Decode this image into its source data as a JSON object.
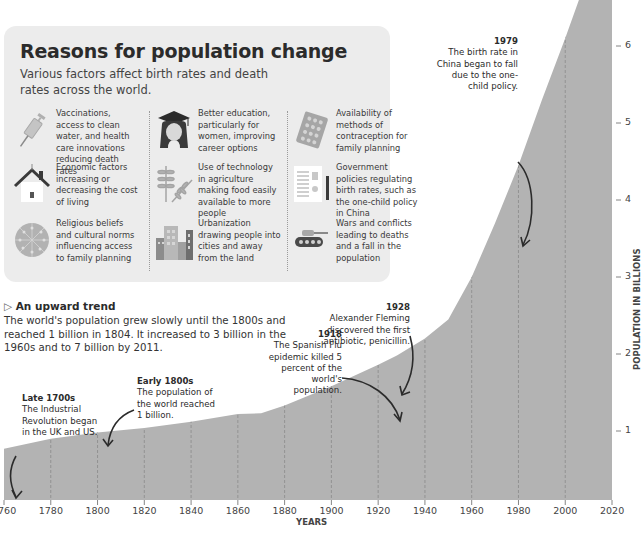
{
  "panel": {
    "title": "Reasons for population change",
    "subtitle": "Various factors affect birth rates and death rates across the world.",
    "factors": [
      {
        "icon": "syringe-icon",
        "text": "Vaccinations, access to clean water, and health care innovations reducing death rates"
      },
      {
        "icon": "graduate-icon",
        "text": "Better education, particularly for women, improving career options"
      },
      {
        "icon": "contraceptive-pill-icon",
        "text": "Availability of methods of contraception for family planning"
      },
      {
        "icon": "house-icon",
        "text": "Economic factors increasing or decreasing the cost of living"
      },
      {
        "icon": "wheat-icon",
        "text": "Use of technology in agriculture making food easily available to more people"
      },
      {
        "icon": "policy-document-icon",
        "text": "Government policies regulating birth rates, such as the one-child policy in China"
      },
      {
        "icon": "religious-symbols-icon",
        "text": "Religious beliefs and cultural norms influencing access to family planning"
      },
      {
        "icon": "city-buildings-icon",
        "text": "Urbanization drawing people into cities and away from the land"
      },
      {
        "icon": "tank-icon",
        "text": "Wars and conflicts leading to deaths and a fall in the population"
      }
    ]
  },
  "trend": {
    "marker": "▷",
    "heading": "An upward trend",
    "body": "The world's population grew slowly until the 1800s and reached 1 billion in 1804. It increased to 3 billion in the 1960s and to 7 billion by 2011."
  },
  "annotations": [
    {
      "id": "late1700s",
      "title": "Late 1700s",
      "text": "The Industrial Revolution began in the UK and US."
    },
    {
      "id": "early1800s",
      "title": "Early 1800s",
      "text": "The population of the world reached 1 billion."
    },
    {
      "id": "y1918",
      "title": "1918",
      "text": "The Spanish Flu epidemic killed 5 percent of the world's population."
    },
    {
      "id": "y1928",
      "title": "1928",
      "text": "Alexander Fleming discovered the first antibiotic, penicillin."
    },
    {
      "id": "y1979",
      "title": "1979",
      "text": "The birth rate in China began to fall due to the one-child policy."
    }
  ],
  "colors": {
    "area": "#b3b3b3",
    "panel": "#ececec",
    "text": "#2b2b2b",
    "gridline": "#8a8a8a"
  },
  "chart_data": {
    "type": "area",
    "title": "",
    "xlabel": "YEARS",
    "ylabel": "POPULATION IN BILLIONS",
    "x_ticks": [
      1760,
      1780,
      1800,
      1820,
      1840,
      1860,
      1880,
      1900,
      1920,
      1940,
      1960,
      1980,
      2000,
      2020
    ],
    "y_ticks": [
      1,
      2,
      3,
      4,
      5,
      6
    ],
    "xlim": [
      1760,
      2020
    ],
    "ylim": [
      0,
      6.5
    ],
    "grid": "vertical dashed lines at each 20-year tick",
    "x": [
      1760,
      1780,
      1800,
      1820,
      1840,
      1860,
      1870,
      1880,
      1900,
      1910,
      1920,
      1928,
      1940,
      1950,
      1960,
      1970,
      1980,
      1990,
      2000,
      2010,
      2020
    ],
    "values": [
      0.77,
      0.9,
      0.98,
      1.04,
      1.12,
      1.22,
      1.23,
      1.33,
      1.58,
      1.72,
      1.86,
      1.98,
      2.2,
      2.45,
      3.0,
      3.7,
      4.45,
      5.3,
      6.1,
      6.95,
      7.8
    ],
    "annotations": [
      {
        "x": 1760,
        "label": "Late 1700s"
      },
      {
        "x": 1805,
        "label": "Early 1800s"
      },
      {
        "x": 1918,
        "label": "1918"
      },
      {
        "x": 1928,
        "label": "1928"
      },
      {
        "x": 1979,
        "label": "1979"
      }
    ]
  }
}
